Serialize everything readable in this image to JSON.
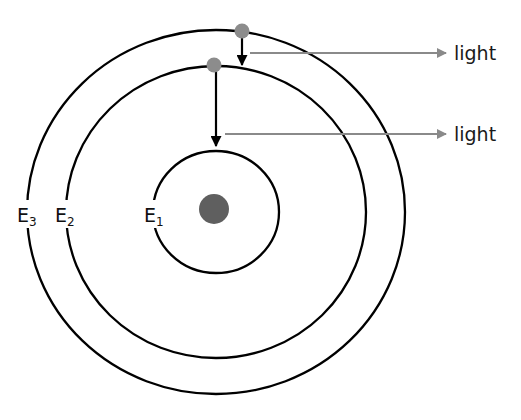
{
  "diagram": {
    "type": "bohr-atom-emission",
    "colors": {
      "orbit": "#000000",
      "electron": "#8c8c8c",
      "nucleus": "#5f5f5f",
      "photon_arrow": "#8a8a8a",
      "transition_arrow": "#000000"
    },
    "orbits": [
      {
        "id": "E1",
        "label_main": "E",
        "label_sub": "1"
      },
      {
        "id": "E2",
        "label_main": "E",
        "label_sub": "2"
      },
      {
        "id": "E3",
        "label_main": "E",
        "label_sub": "3"
      }
    ],
    "transitions": [
      {
        "from": "E3",
        "to": "E2",
        "emits": "light"
      },
      {
        "from": "E2",
        "to": "E1",
        "emits": "light"
      }
    ],
    "light_labels": [
      "light",
      "light"
    ]
  }
}
